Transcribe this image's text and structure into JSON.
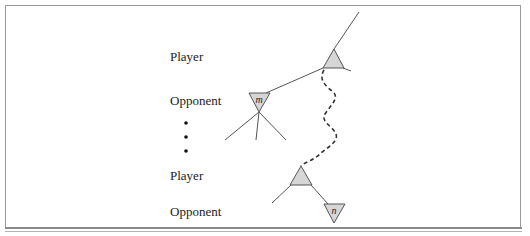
{
  "figure": {
    "levels": [
      {
        "label": "Player",
        "y": 50
      },
      {
        "label": "Opponent",
        "y": 94
      },
      {
        "label": "Player",
        "y": 169
      },
      {
        "label": "Opponent",
        "y": 205
      }
    ],
    "ellipsis_dots": 3,
    "nodes": {
      "m": {
        "label": "m",
        "type": "opponent"
      },
      "n": {
        "label": "n",
        "type": "opponent"
      }
    },
    "colors": {
      "node_fill": "#d6d6d6",
      "edge": "#555555",
      "dashed_path": "#333333"
    }
  }
}
